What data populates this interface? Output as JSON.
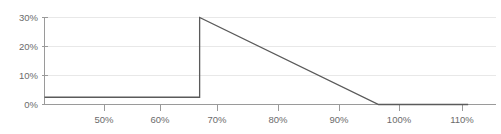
{
  "chart_data": {
    "type": "line",
    "title": "",
    "subtitle": "",
    "xlabel": "",
    "ylabel": "",
    "grid": true,
    "legend": false,
    "xlim": [
      44,
      115
    ],
    "ylim": [
      0,
      32
    ],
    "x_ticks": [
      50,
      60,
      70,
      80,
      90,
      100,
      110
    ],
    "x_tick_labels": [
      "50%",
      "60%",
      "70%",
      "80%",
      "90%",
      "100%",
      "110%"
    ],
    "y_ticks": [
      0,
      10,
      20,
      30
    ],
    "y_tick_labels": [
      "0%",
      "10%",
      "20%",
      "30%"
    ],
    "series": [
      {
        "name": "",
        "color": "#5a5a5a",
        "x": [
          44,
          70,
          70,
          100,
          115
        ],
        "values": [
          2.5,
          2.5,
          30,
          0,
          0
        ]
      }
    ],
    "annotations": []
  },
  "axes": {
    "y_labels": [
      "30%",
      "20%",
      "10%",
      "0%"
    ],
    "x_labels": [
      "50%",
      "60%",
      "70%",
      "80%",
      "90%",
      "100%",
      "110%"
    ]
  },
  "colors": {
    "series": "#5a5a5a",
    "grid": "#e8e8e8",
    "axis": "#9a9a9a",
    "tick_text": "#6b6b6b",
    "background": "#ffffff"
  }
}
